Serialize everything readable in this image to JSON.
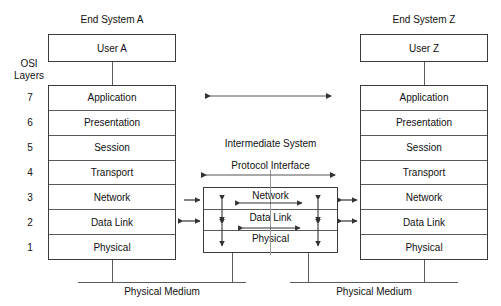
{
  "diagram": {
    "title_left": "End System A",
    "title_right": "End System Z",
    "title_middle": "Intermediate System",
    "protocol_interface_label": "Protocol Interface",
    "osi_label_line1": "OSI",
    "osi_label_line2": "Layers",
    "user_left": "User A",
    "user_right": "User Z",
    "medium_left": "Physical Medium",
    "medium_right": "Physical Medium",
    "layer_numbers": [
      "7",
      "6",
      "5",
      "4",
      "3",
      "2",
      "1"
    ],
    "layers": [
      "Application",
      "Presentation",
      "Session",
      "Transport",
      "Network",
      "Data Link",
      "Physical"
    ],
    "intermediate_layers": [
      "Network",
      "Data Link",
      "Physical"
    ],
    "colors": {
      "line": "#3a3a3a",
      "inner_line": "#5a5a5a",
      "text": "#111111",
      "background": "#ffffff"
    }
  }
}
